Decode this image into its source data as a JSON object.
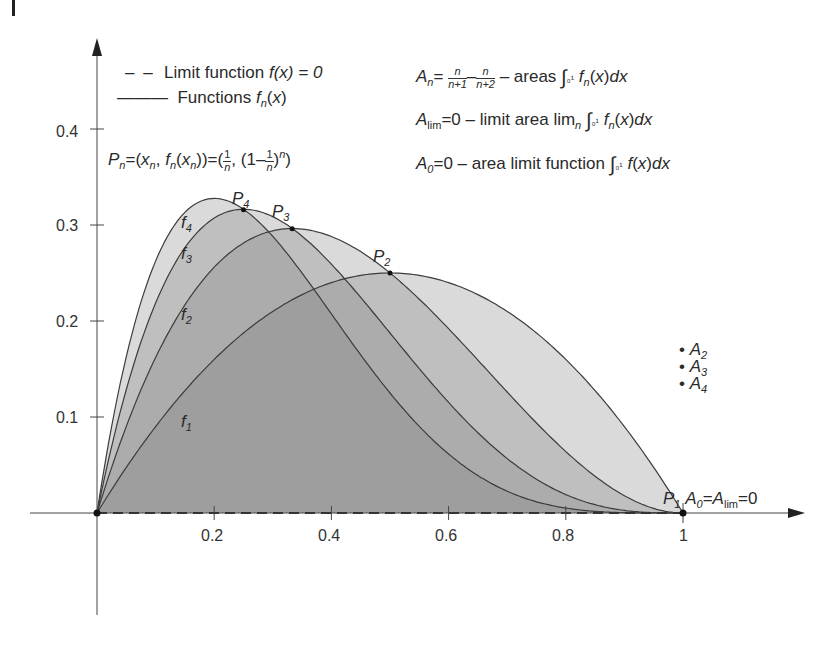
{
  "chart_data": {
    "type": "line",
    "title": "",
    "xlabel": "",
    "ylabel": "",
    "xlim": [
      0,
      1
    ],
    "ylim": [
      0,
      0.4
    ],
    "grid": false,
    "x_ticks": [
      "0.2",
      "0.4",
      "0.6",
      "0.8",
      "1"
    ],
    "y_ticks": [
      "0.1",
      "0.2",
      "0.3",
      "0.4"
    ],
    "series": [
      {
        "name": "f1",
        "formula": "x(1-x)",
        "peak": [
          0.5,
          0.25
        ]
      },
      {
        "name": "f2",
        "formula": "2x(1-x)^2",
        "peak": [
          0.333,
          0.296
        ]
      },
      {
        "name": "f3",
        "formula": "3x(1-x)^3",
        "peak": [
          0.25,
          0.316
        ]
      },
      {
        "name": "f4",
        "formula": "4x(1-x)^4",
        "peak": [
          0.2,
          0.328
        ]
      },
      {
        "name": "Limit function f(x)=0",
        "style": "dashed",
        "values": [
          0,
          0
        ]
      }
    ],
    "points": [
      {
        "label": "P1",
        "x": 1,
        "y": 0
      },
      {
        "label": "P2",
        "x": 0.5,
        "y": 0.25
      },
      {
        "label": "P3",
        "x": 0.333,
        "y": 0.296
      },
      {
        "label": "P4",
        "x": 0.25,
        "y": 0.316
      }
    ],
    "legend": [
      "Limit function f(x)=0",
      "Functions fn(x)"
    ],
    "annotations": [
      "An = n/(n+1) − n/(n+2) – areas ∫0^1 fn(x)dx",
      "Alim = 0 – limit area limn ∫0^1 fn(x)dx",
      "A0 = 0 – area limit function ∫0^1 f(x)dx",
      "Pn = (xn, fn(xn)) = (1/n, (1−1/n)^n)",
      "A2",
      "A3",
      "A4",
      "A0 = Alim = 0"
    ]
  },
  "legend": {
    "dashed_label": "Limit function ",
    "dashed_expr": "f(x) = 0",
    "solid_label": "Functions "
  },
  "text": {
    "an_desc": " – areas ",
    "alim_desc": "=0 – limit area lim",
    "a0_desc": "=0 – area limit function ",
    "p1": "P",
    "a0_alim": "=0"
  },
  "labels": {
    "f1": "f",
    "f2": "f",
    "f3": "f",
    "f4": "f",
    "A2": "A",
    "A3": "A",
    "A4": "A"
  },
  "ticks": {
    "x": [
      "0.2",
      "0.4",
      "0.6",
      "0.8",
      "1"
    ],
    "y": [
      "0.1",
      "0.2",
      "0.3",
      "0.4"
    ]
  },
  "colors": {
    "axis": "#444444",
    "curve": "#3c3c3c",
    "fill": "#7a7a7a"
  }
}
